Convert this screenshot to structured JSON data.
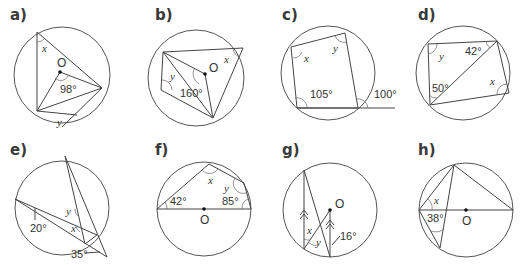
{
  "diagrams": [
    {
      "label": "a)",
      "center": "O",
      "angles": [
        "98°"
      ],
      "unknowns": [
        "x",
        "y"
      ]
    },
    {
      "label": "b)",
      "center": "O",
      "angles": [
        "160°"
      ],
      "unknowns": [
        "x",
        "y"
      ]
    },
    {
      "label": "c)",
      "angles": [
        "105°",
        "100°"
      ],
      "unknowns": [
        "x",
        "y"
      ]
    },
    {
      "label": "d)",
      "angles": [
        "42°",
        "50°"
      ],
      "unknowns": [
        "x",
        "y"
      ]
    },
    {
      "label": "e)",
      "angles": [
        "20°",
        "35°"
      ],
      "unknowns": [
        "x",
        "y"
      ]
    },
    {
      "label": "f)",
      "center": "O",
      "angles": [
        "42°",
        "85°"
      ],
      "unknowns": [
        "x",
        "y"
      ]
    },
    {
      "label": "g)",
      "center": "O",
      "angles": [
        "16°"
      ],
      "unknowns": [
        "x",
        "y"
      ]
    },
    {
      "label": "h)",
      "center": "O",
      "angles": [
        "38°"
      ],
      "unknowns": [
        "x"
      ]
    }
  ]
}
